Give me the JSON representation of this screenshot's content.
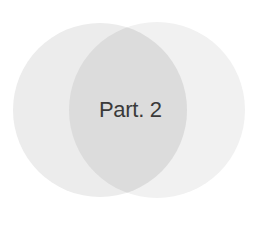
{
  "diagram": {
    "type": "venn",
    "sets": [
      {
        "name": "left-set",
        "color": "#ececec"
      },
      {
        "name": "right-set",
        "color": "#f1f1f1"
      }
    ],
    "intersection": {
      "label": "Part. 2",
      "color": "#dcdcdc"
    }
  },
  "colors": {
    "background": "#ffffff",
    "text": "#3a3a3a"
  }
}
